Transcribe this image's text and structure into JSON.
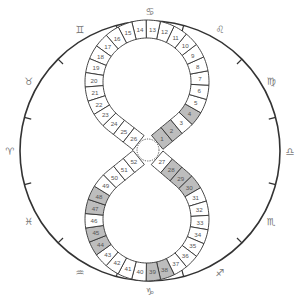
{
  "colors": {
    "outline": "#333333",
    "cell_fill": "#ffffff",
    "cell_shaded": "#bdbdbd",
    "number_text": "#555555",
    "sign_text": "#777777"
  },
  "board": {
    "outer_circle": {
      "cx": 150,
      "cy": 151,
      "r": 130
    },
    "center_hub": {
      "cx": 148,
      "cy": 150,
      "r": 11,
      "style": "dotted"
    },
    "top_loop": {
      "cx": 147,
      "cy": 82,
      "r_mid": 53,
      "cells": [
        1,
        26
      ]
    },
    "bottom_loop": {
      "cx": 147,
      "cy": 219,
      "r_mid": 53,
      "cells": [
        27,
        52
      ]
    },
    "band_width": 18
  },
  "cells": {
    "count": 52,
    "shaded": [
      1,
      2,
      4,
      28,
      29,
      30,
      38,
      39,
      44,
      45,
      47,
      48
    ]
  },
  "zodiac_signs": [
    {
      "name": "cancer",
      "glyph": "♋",
      "angle": 90
    },
    {
      "name": "leo",
      "glyph": "♌",
      "angle": 60
    },
    {
      "name": "virgo",
      "glyph": "♍",
      "angle": 30
    },
    {
      "name": "libra",
      "glyph": "♎",
      "angle": 0
    },
    {
      "name": "scorpio",
      "glyph": "♏",
      "angle": -30
    },
    {
      "name": "sagittarius",
      "glyph": "♐",
      "angle": -60
    },
    {
      "name": "capricorn",
      "glyph": "♑",
      "angle": -90
    },
    {
      "name": "aquarius",
      "glyph": "♒",
      "angle": -120
    },
    {
      "name": "pisces",
      "glyph": "♓",
      "angle": -150
    },
    {
      "name": "aries",
      "glyph": "♈",
      "angle": 180
    },
    {
      "name": "taurus",
      "glyph": "♉",
      "angle": 150
    },
    {
      "name": "gemini",
      "glyph": "♊",
      "angle": 120
    }
  ],
  "tick_angles": [
    75,
    45,
    15,
    -15,
    -45,
    -75,
    -105,
    -135,
    -165,
    165,
    135,
    105
  ]
}
